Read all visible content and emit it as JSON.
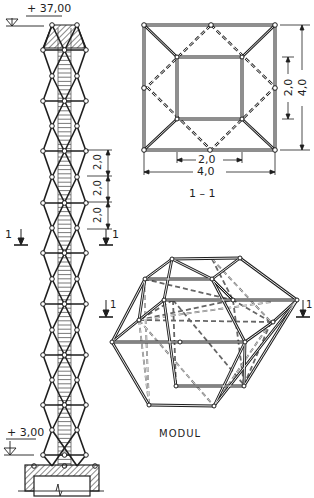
{
  "tower": {
    "elevation_top": "+ 37,00",
    "elevation_bottom": "+ 3,00",
    "module_dims": [
      "2,0",
      "2,0",
      "2,0"
    ],
    "section_marker_left": "1",
    "section_marker_right": "1"
  },
  "plan": {
    "title": "1 – 1",
    "dim_inner_width": "2,0",
    "dim_outer_width": "4,0",
    "dim_inner_height": "2,0",
    "dim_outer_height": "4,0"
  },
  "module": {
    "title": "MODUL",
    "section_marker_left": "1",
    "section_marker_right": "1"
  },
  "colors": {
    "ink": "#1e1e1e",
    "paper": "#ffffff",
    "hatch": "#3a3a3a"
  }
}
